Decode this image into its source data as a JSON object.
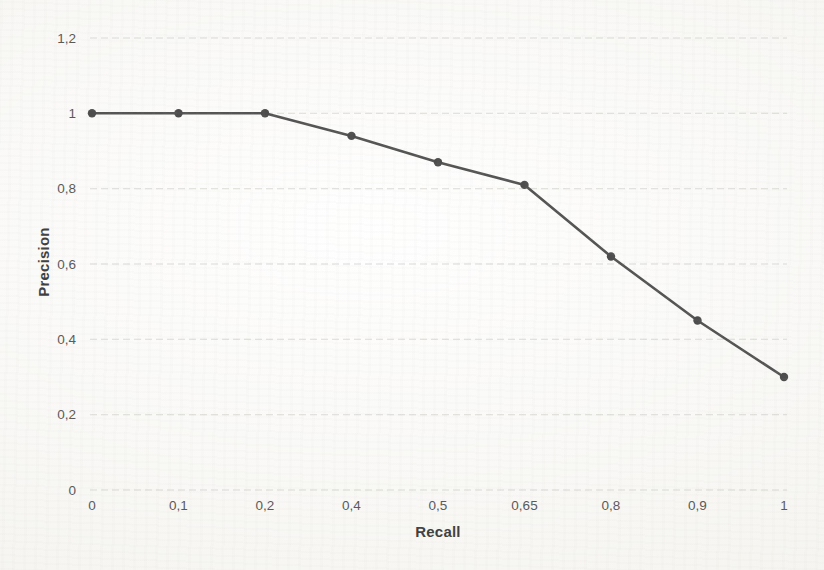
{
  "page": {
    "background_color": "#fbfaf7"
  },
  "chart_data": {
    "type": "line",
    "title": "",
    "xlabel": "Recall",
    "ylabel": "Precision",
    "categories": [
      "0",
      "0,1",
      "0,2",
      "0,4",
      "0,5",
      "0,65",
      "0,8",
      "0,9",
      "1"
    ],
    "series": [
      {
        "name": "Precision-Recall curve",
        "values": [
          1.0,
          1.0,
          1.0,
          0.94,
          0.87,
          0.81,
          0.62,
          0.45,
          0.3
        ]
      }
    ],
    "ylim": [
      0,
      1.2
    ],
    "y_tick_values": [
      0,
      0.2,
      0.4,
      0.6,
      0.8,
      1.0,
      1.2
    ],
    "y_tick_labels": [
      "0",
      "0,2",
      "0,4",
      "0,6",
      "0,8",
      "1",
      "1,2"
    ],
    "decimal_separator": ",",
    "grid": "horizontal dashed gridlines on",
    "legend": "none",
    "colors": {
      "line": "#545454",
      "marker": "#4d4d4d",
      "gridline": "#d6d5d0",
      "tick_text": "#595959",
      "axis_title_text": "#3f3f3f"
    },
    "marker_style": "circle"
  }
}
